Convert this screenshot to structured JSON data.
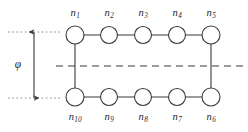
{
  "figure": {
    "type": "node-chain-diagram",
    "colors": {
      "background": "#ffffff",
      "stroke": "#3a3a3a",
      "text": "#2a2a2a",
      "dashed_line": "#3a3a3a",
      "dotted_guide": "#8a8a8a",
      "arrow": "#3a3a3a"
    },
    "nodes": [
      {
        "id": "n1",
        "label_base": "n",
        "label_sub": "1",
        "cx": 75,
        "cy": 35,
        "r": 9,
        "label_x": 75,
        "label_y": 8,
        "label_pos": "above"
      },
      {
        "id": "n2",
        "label_base": "n",
        "label_sub": "2",
        "cx": 109,
        "cy": 35,
        "r": 8.5,
        "label_x": 109,
        "label_y": 8,
        "label_pos": "above"
      },
      {
        "id": "n3",
        "label_base": "n",
        "label_sub": "3",
        "cx": 143,
        "cy": 35,
        "r": 8.5,
        "label_x": 143,
        "label_y": 8,
        "label_pos": "above"
      },
      {
        "id": "n4",
        "label_base": "n",
        "label_sub": "4",
        "cx": 177,
        "cy": 35,
        "r": 8.5,
        "label_x": 177,
        "label_y": 8,
        "label_pos": "above"
      },
      {
        "id": "n5",
        "label_base": "n",
        "label_sub": "5",
        "cx": 211,
        "cy": 35,
        "r": 9,
        "label_x": 211,
        "label_y": 8,
        "label_pos": "above"
      },
      {
        "id": "n6",
        "label_base": "n",
        "label_sub": "6",
        "cx": 211,
        "cy": 97,
        "r": 9,
        "label_x": 211,
        "label_y": 112,
        "label_pos": "below"
      },
      {
        "id": "n7",
        "label_base": "n",
        "label_sub": "7",
        "cx": 177,
        "cy": 97,
        "r": 8.5,
        "label_x": 177,
        "label_y": 112,
        "label_pos": "below"
      },
      {
        "id": "n8",
        "label_base": "n",
        "label_sub": "8",
        "cx": 143,
        "cy": 97,
        "r": 8.5,
        "label_x": 143,
        "label_y": 112,
        "label_pos": "below"
      },
      {
        "id": "n9",
        "label_base": "n",
        "label_sub": "9",
        "cx": 109,
        "cy": 97,
        "r": 8.5,
        "label_x": 109,
        "label_y": 112,
        "label_pos": "below"
      },
      {
        "id": "n10",
        "label_base": "n",
        "label_sub": "10",
        "cx": 75,
        "cy": 97,
        "r": 9,
        "label_x": 75,
        "label_y": 112,
        "label_pos": "below"
      }
    ],
    "edges": [
      {
        "from": "n1",
        "to": "n2",
        "x1": 84,
        "y1": 35,
        "x2": 100.5,
        "y2": 35
      },
      {
        "from": "n2",
        "to": "n3",
        "x1": 117.5,
        "y1": 35,
        "x2": 134.5,
        "y2": 35
      },
      {
        "from": "n3",
        "to": "n4",
        "x1": 151.5,
        "y1": 35,
        "x2": 168.5,
        "y2": 35
      },
      {
        "from": "n4",
        "to": "n5",
        "x1": 185.5,
        "y1": 35,
        "x2": 202,
        "y2": 35
      },
      {
        "from": "n5",
        "to": "n6",
        "x1": 211,
        "y1": 44,
        "x2": 211,
        "y2": 88
      },
      {
        "from": "n6",
        "to": "n7",
        "x1": 202,
        "y1": 97,
        "x2": 185.5,
        "y2": 97
      },
      {
        "from": "n7",
        "to": "n8",
        "x1": 168.5,
        "y1": 97,
        "x2": 151.5,
        "y2": 97
      },
      {
        "from": "n8",
        "to": "n9",
        "x1": 134.5,
        "y1": 97,
        "x2": 117.5,
        "y2": 97
      },
      {
        "from": "n9",
        "to": "n10",
        "x1": 100.5,
        "y1": 97,
        "x2": 84,
        "y2": 97
      },
      {
        "from": "n10",
        "to": "n1",
        "x1": 75,
        "y1": 88,
        "x2": 75,
        "y2": 44
      }
    ],
    "mid_plane": {
      "name": "dashed-midline",
      "x1": 56,
      "x2": 244,
      "y": 66,
      "dash": "7 5"
    },
    "guides": [
      {
        "name": "top-guide",
        "x1": 8,
        "x2": 62,
        "y": 32
      },
      {
        "name": "bottom-guide",
        "x1": 8,
        "x2": 62,
        "y": 98
      }
    ],
    "dimension": {
      "name": "phi-dimension",
      "symbol": "φ",
      "x": 34,
      "y_top": 32,
      "y_bottom": 98,
      "label_x": 18,
      "label_y": 65
    }
  }
}
